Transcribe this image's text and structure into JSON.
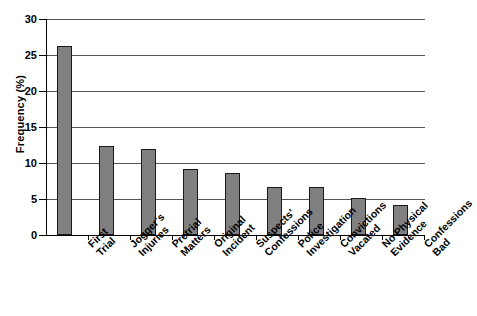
{
  "chart_data": {
    "type": "bar",
    "title": "",
    "xlabel": "",
    "ylabel": "Frequency (%)",
    "ylim": [
      0,
      30
    ],
    "ytick_step": 5,
    "yticks": [
      "0",
      "5",
      "10",
      "15",
      "20",
      "25",
      "30"
    ],
    "grid": true,
    "legend": "none",
    "bar_color": "#808080",
    "bar_border_color": "#1a1a1a",
    "categories": [
      "First Trial",
      "Jogger's Injuries",
      "Pretrial Matters",
      "Original Incident",
      "Suspects' Confessions",
      "Police Investigation",
      "Convictions Vacated",
      "No Physical Evidence",
      "Confessions Bad"
    ],
    "category_lines": [
      [
        "First",
        "Trial"
      ],
      [
        "Jogger's",
        "Injuries"
      ],
      [
        "Pretrial",
        "Matters"
      ],
      [
        "Original",
        "Incident"
      ],
      [
        "Suspects'",
        "Confessions"
      ],
      [
        "Police",
        "Investigation"
      ],
      [
        "Convictions",
        "Vacated"
      ],
      [
        "No Physical",
        "Evidence"
      ],
      [
        "Confessions",
        "Bad"
      ]
    ],
    "values": [
      26.3,
      12.3,
      12.0,
      9.1,
      8.6,
      6.7,
      6.7,
      5.1,
      4.2
    ]
  }
}
